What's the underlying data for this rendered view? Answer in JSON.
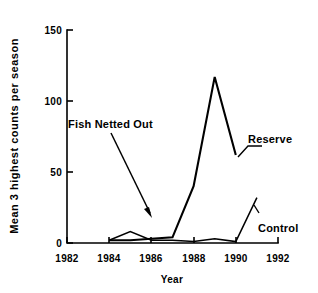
{
  "chart_data": {
    "type": "line",
    "title": "",
    "xlabel": "Year",
    "ylabel": "Mean 3 highest counts per season",
    "xlim": [
      1982,
      1992
    ],
    "ylim": [
      0,
      150
    ],
    "xticks": [
      1982,
      1984,
      1986,
      1988,
      1990,
      1992
    ],
    "yticks": [
      0,
      50,
      100,
      150
    ],
    "xtick_labels": [
      "1982",
      "1984",
      "1986",
      "1988",
      "1990",
      "1992"
    ],
    "ytick_labels": [
      "0",
      "50",
      "100",
      "150"
    ],
    "grid": false,
    "legend": "inline-labels",
    "series": [
      {
        "name": "Reserve",
        "x": [
          1984,
          1985,
          1986,
          1987,
          1988,
          1989,
          1990
        ],
        "values": [
          2,
          2,
          3,
          4,
          40,
          117,
          62
        ]
      },
      {
        "name": "Control",
        "x": [
          1984,
          1985,
          1986,
          1987,
          1988,
          1989,
          1990,
          1991
        ],
        "values": [
          2,
          8,
          2,
          2,
          1,
          3,
          1,
          32
        ]
      }
    ],
    "annotations": [
      {
        "text": "Fish Netted Out",
        "x": 1986,
        "y": 22,
        "label_x": 1983.2,
        "label_y": 88
      }
    ]
  },
  "labels": {
    "reserve": "Reserve",
    "control": "Control",
    "annotation": "Fish Netted Out",
    "x_axis_title": "Year",
    "y_axis_title": "Mean 3 highest counts per season",
    "ytick_0": "0",
    "ytick_50": "50",
    "ytick_100": "100",
    "ytick_150": "150",
    "xtick_1982": "1982",
    "xtick_1984": "1984",
    "xtick_1986": "1986",
    "xtick_1988": "1988",
    "xtick_1990": "1990",
    "xtick_1992": "1992"
  },
  "colors": {
    "ink": "#000000",
    "background": "#ffffff"
  }
}
